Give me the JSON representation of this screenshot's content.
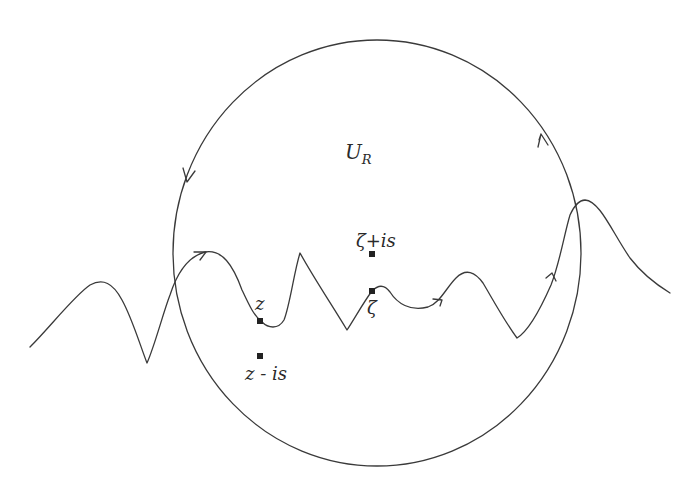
{
  "diagram": {
    "region_label": {
      "main": "U",
      "subscript": "R"
    },
    "points": [
      {
        "id": "z",
        "label": "z",
        "x": 260,
        "y": 321
      },
      {
        "id": "z-minus-is",
        "label": "z - is",
        "x": 260,
        "y": 356
      },
      {
        "id": "zeta",
        "label": "ζ",
        "x": 372,
        "y": 291
      },
      {
        "id": "zeta-plus-is",
        "label": "ζ+is",
        "x": 372,
        "y": 254
      }
    ],
    "labels": {
      "z": "z",
      "z_minus_is": "z - is",
      "zeta": "ζ",
      "zeta_plus_is": "ζ+is"
    },
    "circle": {
      "cx": 377,
      "cy": 253,
      "rx": 204,
      "ry": 213,
      "orientation": "counterclockwise"
    },
    "colors": {
      "stroke": "#3a3a3a",
      "background": "#ffffff"
    }
  }
}
